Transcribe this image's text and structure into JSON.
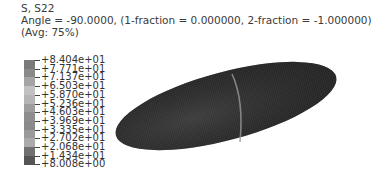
{
  "header": {
    "variable": "S, S22",
    "angle_line": "Angle = -90.0000, (1-fraction = 0.000000, 2-fraction = -1.000000)",
    "averaging": "(Avg: 75%)"
  },
  "legend": {
    "labels": [
      "+8.404e+01",
      "+7.771e+01",
      "+7.137e+01",
      "+6.503e+01",
      "+5.870e+01",
      "+5.236e+01",
      "+4.603e+01",
      "+3.969e+01",
      "+3.335e+01",
      "+2.702e+01",
      "+2.068e+01",
      "+1.434e+01",
      "+8.008e+00"
    ],
    "colors": [
      "#7a7a7a",
      "#8a8a8a",
      "#a5a5a5",
      "#c2c2c2",
      "#b5b5b5",
      "#9e9e9e",
      "#8e8e8e",
      "#8a8a8a",
      "#9a9a9a",
      "#aaaaaa",
      "#707070",
      "#555555"
    ]
  },
  "model": {
    "shape": "ellipsoid",
    "fill_color": "#2b2b2b",
    "seam_color": "#9a9a9a"
  }
}
